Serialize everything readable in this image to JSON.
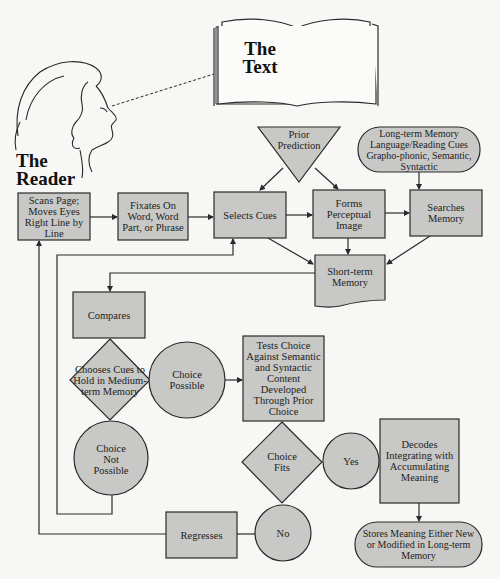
{
  "caption": "A Model of the Reading Process",
  "illustration": {
    "book_label": "The Text",
    "reader_label": "The Reader"
  },
  "colors": {
    "shape_fill": "#c8c8c6",
    "stroke": "#2a2a2a",
    "background": "#f7f7f5"
  },
  "nodes": {
    "scans": {
      "label": "Scans Page; Moves Eyes Right Line by Line",
      "shape": "rectangle"
    },
    "fixates": {
      "label": "Fixates On Word, Word Part, or Phrase",
      "shape": "rectangle"
    },
    "selects_cues": {
      "label": "Selects Cues",
      "shape": "rectangle"
    },
    "forms_image": {
      "label": "Forms Perceptual Image",
      "shape": "rectangle"
    },
    "searches_memory": {
      "label": "Searches Memory",
      "shape": "rectangle"
    },
    "prior_prediction": {
      "label": "Prior Prediction",
      "shape": "triangle"
    },
    "long_term_memory": {
      "label": "Long-term Memory Language/Reading Cues Grapho-phonic, Semantic, Syntactic",
      "shape": "pill"
    },
    "short_term_memory": {
      "label": "Short-term Memory",
      "shape": "document"
    },
    "compares": {
      "label": "Compares",
      "shape": "rectangle"
    },
    "chooses_cues": {
      "label": "Chooses Cues to Hold in Medium-term Memory",
      "shape": "diamond"
    },
    "choice_possible": {
      "label": "Choice Possible",
      "shape": "circle"
    },
    "choice_not_possible": {
      "label": "Choice Not Possible",
      "shape": "circle"
    },
    "tests_choice": {
      "label": "Tests Choice Against Semantic and Syntactic Content Developed Through Prior Choice",
      "shape": "rectangle"
    },
    "choice_fits": {
      "label": "Choice Fits",
      "shape": "diamond"
    },
    "yes": {
      "label": "Yes",
      "shape": "circle"
    },
    "no": {
      "label": "No",
      "shape": "circle"
    },
    "decodes": {
      "label": "Decodes Integrating with Accumulating Meaning",
      "shape": "rectangle"
    },
    "regresses": {
      "label": "Regresses",
      "shape": "rectangle"
    },
    "stores_meaning": {
      "label": "Stores Meaning Either New or Modified in Long-term Memory",
      "shape": "pill"
    }
  },
  "edges": [
    [
      "reader",
      "text",
      "gaze (dashed)"
    ],
    [
      "scans",
      "fixates"
    ],
    [
      "fixates",
      "selects_cues"
    ],
    [
      "prior_prediction",
      "selects_cues"
    ],
    [
      "prior_prediction",
      "forms_image"
    ],
    [
      "selects_cues",
      "forms_image"
    ],
    [
      "forms_image",
      "searches_memory"
    ],
    [
      "long_term_memory",
      "searches_memory"
    ],
    [
      "selects_cues",
      "short_term_memory"
    ],
    [
      "forms_image",
      "short_term_memory"
    ],
    [
      "searches_memory",
      "short_term_memory"
    ],
    [
      "short_term_memory",
      "compares"
    ],
    [
      "compares",
      "chooses_cues"
    ],
    [
      "chooses_cues",
      "choice_possible"
    ],
    [
      "chooses_cues",
      "choice_not_possible"
    ],
    [
      "choice_possible",
      "tests_choice"
    ],
    [
      "choice_not_possible",
      "selects_cues"
    ],
    [
      "tests_choice",
      "choice_fits"
    ],
    [
      "choice_fits",
      "yes"
    ],
    [
      "choice_fits",
      "no"
    ],
    [
      "yes",
      "decodes"
    ],
    [
      "decodes",
      "stores_meaning"
    ],
    [
      "no",
      "regresses"
    ],
    [
      "regresses",
      "scans"
    ]
  ]
}
